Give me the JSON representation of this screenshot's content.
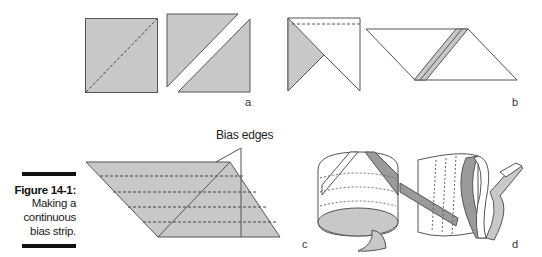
{
  "figure": {
    "number": "Figure 14-1:",
    "caption_lines": [
      "Making a",
      "continuous",
      "bias strip."
    ],
    "panel_labels": [
      "a",
      "b",
      "c",
      "d"
    ],
    "annotation": "Bias edges"
  },
  "colors": {
    "fabric_fill": "#c8c8c8",
    "dark_strip": "#9a9a9a",
    "stroke": "#555555"
  }
}
